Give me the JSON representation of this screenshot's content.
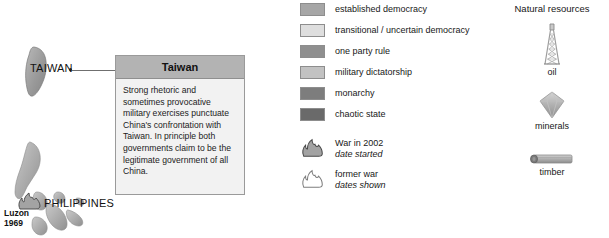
{
  "map": {
    "labels": [
      {
        "name": "taiwan",
        "text": "TAIWAN"
      },
      {
        "name": "philippines",
        "text": "PHILIPPINES"
      }
    ],
    "annotations": [
      {
        "name": "luzon-war-marker",
        "line1": "Luzon",
        "line2": "1969"
      }
    ]
  },
  "callout": {
    "title": "Taiwan",
    "body": "Strong rhetoric and sometimes provocative military exercises punctuate China's confrontation with Taiwan. In principle both governments claim to be the legitimate government of all China."
  },
  "legend": {
    "categories": [
      {
        "label": "established democracy",
        "color": "#a6a6a6"
      },
      {
        "label": "transitional / uncertain democracy",
        "color": "#dedede"
      },
      {
        "label": "one party rule",
        "color": "#8f8f8f"
      },
      {
        "label": "military dictatorship",
        "color": "#c2c2c2"
      },
      {
        "label": "monarchy",
        "color": "#7d7d7d"
      },
      {
        "label": "chaotic state",
        "color": "#6a6a6a"
      }
    ],
    "war_markers": [
      {
        "icon": "flame-solid-icon",
        "label": "War in 2002",
        "sub": "date started"
      },
      {
        "icon": "flame-outline-icon",
        "label": "former war",
        "sub": "dates shown"
      }
    ]
  },
  "resources": {
    "title": "Natural resources",
    "items": [
      {
        "icon": "oil-derrick-icon",
        "caption": "oil"
      },
      {
        "icon": "gem-icon",
        "caption": "minerals"
      },
      {
        "icon": "log-icon",
        "caption": "timber"
      }
    ]
  }
}
